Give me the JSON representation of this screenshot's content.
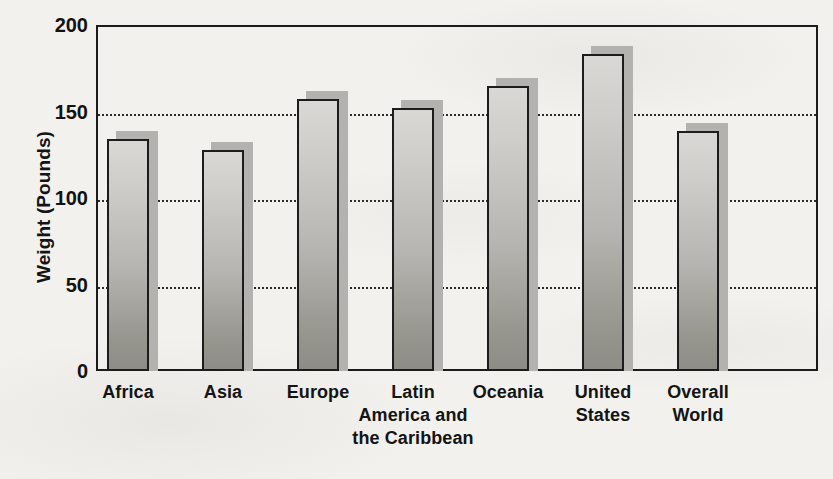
{
  "chart_data": {
    "type": "bar",
    "title": "",
    "xlabel": "",
    "ylabel": "Weight (Pounds)",
    "ylim": [
      0,
      200
    ],
    "yticks": [
      0,
      50,
      100,
      150,
      200
    ],
    "ytick_labels": [
      "0",
      "50",
      "100",
      "150",
      "200"
    ],
    "grid": "horizontal-dotted",
    "legend": "none",
    "categories": [
      "Africa",
      "Asia",
      "Europe",
      "Latin America and the Caribbean",
      "Oceania",
      "United States",
      "Overall World"
    ],
    "category_label_lines": [
      [
        "Africa"
      ],
      [
        "Asia"
      ],
      [
        "Europe"
      ],
      [
        "Latin",
        "America and",
        "the Caribbean"
      ],
      [
        "Oceania"
      ],
      [
        "United",
        "States"
      ],
      [
        "Overall",
        "World"
      ]
    ],
    "values": [
      134,
      128,
      157,
      152,
      165,
      183,
      139
    ],
    "series": [
      {
        "name": "Average body weight",
        "values": [
          134,
          128,
          157,
          152,
          165,
          183,
          139
        ]
      }
    ]
  },
  "style": {
    "bar_fill_top": "#d9d8d5",
    "bar_fill_bottom": "#8d8c86",
    "bar_outline": "#1c1c1c",
    "bar_shadow": "#b4b2ae",
    "gridline_color": "#2a2a2a",
    "axis_color": "#1b1b1b",
    "text_color": "#141414",
    "background": "#f2f1ee"
  }
}
